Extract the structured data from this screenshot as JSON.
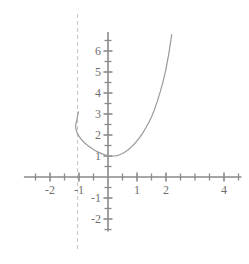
{
  "chart_data": {
    "type": "line",
    "title": "",
    "subtitle": "",
    "xlabel": "",
    "ylabel": "",
    "xlim": [
      -2.9,
      4.6
    ],
    "ylim": [
      -2.6,
      6.9
    ],
    "grid": false,
    "legend": null,
    "x_tick_labels": [
      "-2",
      "-1",
      "1",
      "2",
      "4"
    ],
    "x_tick_values": [
      -2,
      -1,
      1,
      2,
      4
    ],
    "x_minor_ticks": [
      -2.5,
      -1.5,
      -0.5,
      0.5,
      1.5,
      2.5,
      3,
      3.5,
      4.5
    ],
    "y_tick_labels": [
      "6",
      "5",
      "4",
      "3",
      "2",
      "1",
      "-1",
      "-2"
    ],
    "y_tick_values": [
      6,
      5,
      4,
      3,
      2,
      1,
      -1,
      -2
    ],
    "y_minor_ticks": [
      6.5,
      5.5,
      4.5,
      3.5,
      2.5,
      1.5,
      0.5,
      -0.5,
      -1.5,
      -2.5
    ],
    "annotations": [
      {
        "name": "vertical-asymptote",
        "style": "dashed",
        "x": -1.05,
        "color": "#c9c9c9"
      }
    ],
    "series": [
      {
        "name": "curve",
        "color": "#9a9a9a",
        "points_x": [
          -1.02,
          -1.03,
          -1.05,
          -1.08,
          -1.1,
          -1.12,
          -1.1,
          -1.05,
          -0.98,
          -0.9,
          -0.8,
          -0.7,
          -0.6,
          -0.5,
          -0.4,
          -0.3,
          -0.2,
          -0.1,
          0.0,
          0.1,
          0.2,
          0.3,
          0.4,
          0.5,
          0.6,
          0.7,
          0.8,
          0.9,
          1.0,
          1.1,
          1.2,
          1.3,
          1.4,
          1.5,
          1.6,
          1.7,
          1.8,
          1.9,
          2.0,
          2.1,
          2.2
        ],
        "points_y": [
          3.12,
          3.05,
          2.9,
          2.7,
          2.55,
          2.4,
          2.25,
          2.05,
          1.9,
          1.76,
          1.62,
          1.5,
          1.4,
          1.31,
          1.23,
          1.16,
          1.1,
          1.05,
          1.01,
          1.0,
          1.0,
          1.02,
          1.06,
          1.12,
          1.2,
          1.3,
          1.42,
          1.56,
          1.72,
          1.9,
          2.1,
          2.33,
          2.58,
          2.86,
          3.2,
          3.6,
          4.05,
          4.55,
          5.15,
          5.9,
          6.8
        ]
      }
    ]
  },
  "figure": {
    "origin_px": {
      "x": 108,
      "y": 177
    },
    "unit_px": {
      "x": 29,
      "y": 21
    },
    "background_color": "#ffffff",
    "axis_color": "#8a8a8a",
    "curve_color": "#9a9a9a",
    "asymptote_color": "#c9c9c9"
  }
}
